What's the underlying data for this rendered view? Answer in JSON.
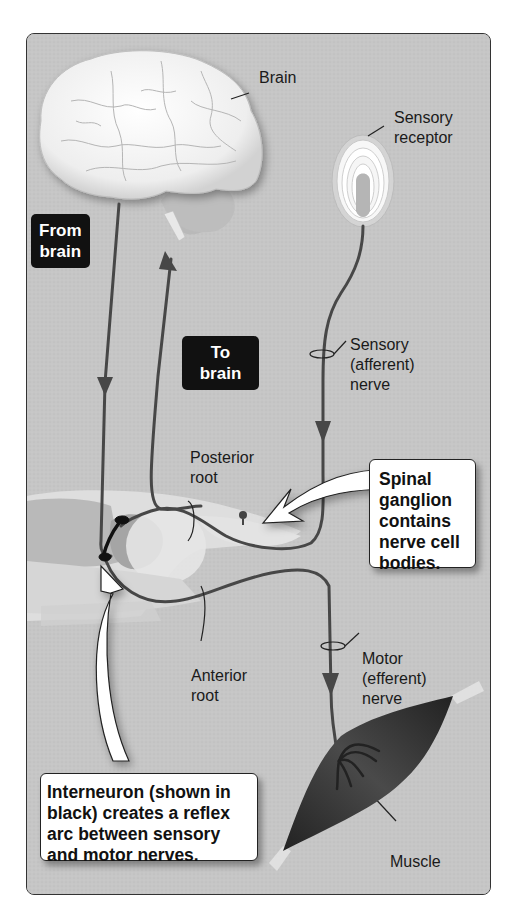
{
  "diagram": {
    "type": "reflex-arc-illustration",
    "colors": {
      "panel_background": "#c4c4c4",
      "nerve": "#4a4a4a",
      "interneuron": "#111111",
      "label_box": "#111111",
      "callout_background": "#ffffff",
      "muscle": "#2f2f2f",
      "brain": "#f2f2f2"
    },
    "labels": {
      "brain": "Brain",
      "sensory_receptor": "Sensory\nreceptor",
      "from_brain": "From\nbrain",
      "to_brain": "To\nbrain",
      "sensory_nerve": "Sensory\n(afferent)\nnerve",
      "posterior_root": "Posterior\nroot",
      "anterior_root": "Anterior\nroot",
      "motor_nerve": "Motor\n(efferent)\nnerve",
      "muscle": "Muscle"
    },
    "callouts": {
      "spinal_ganglion": "Spinal\nganglion\ncontains\nnerve cell\nbodies.",
      "interneuron": "Interneuron (shown in\nblack) creates a reflex\narc between sensory\nand motor nerves."
    }
  }
}
